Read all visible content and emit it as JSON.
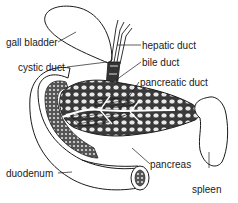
{
  "diagram": {
    "type": "anatomical",
    "colors": {
      "ink": "#1a1a1a",
      "background": "#ffffff"
    },
    "labels": {
      "gall_bladder": "gall bladder",
      "cystic_duct": "cystic duct",
      "hepatic_duct": "hepatic duct",
      "bile_duct": "bile duct",
      "pancreatic_duct": "pancreatic duct",
      "pancreas": "pancreas",
      "duodenum": "duodenum",
      "spleen": "spleen"
    }
  }
}
